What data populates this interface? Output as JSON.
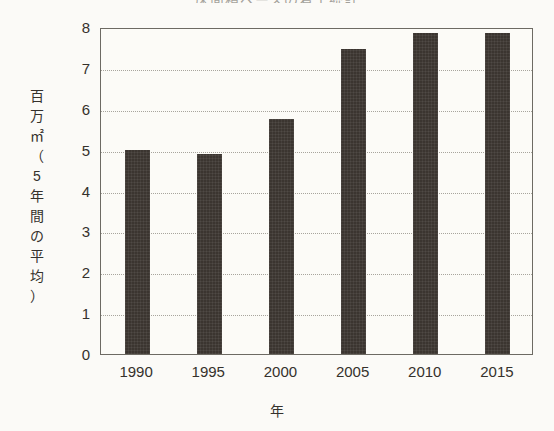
{
  "chart_data": {
    "type": "bar",
    "title": "床面積ベースの着工統計",
    "categories": [
      "1990",
      "1995",
      "2000",
      "2005",
      "2010",
      "2015"
    ],
    "values": [
      5.0,
      4.9,
      5.75,
      7.45,
      7.85,
      7.85
    ],
    "xlabel": "年",
    "ylabel": "百万㎡（5年間の平均）",
    "ylabel_chars": [
      "百",
      "万",
      "㎡",
      "（",
      "5",
      "年",
      "間",
      "の",
      "平",
      "均",
      "）"
    ],
    "ylim": [
      0,
      8
    ],
    "ytick_labels": [
      "8",
      "7",
      "6",
      "5",
      "4",
      "3",
      "2",
      "1",
      "0"
    ],
    "ytick_values": [
      8,
      7,
      6,
      5,
      4,
      3,
      2,
      1,
      0
    ],
    "grid": true,
    "grid_style": "dotted-horizontal",
    "legend": null,
    "bar_color": "#3b3530",
    "plot_background": "#fcfbf7",
    "frame_color": "#6d6a63",
    "gridline_color": "#a8a59d"
  }
}
